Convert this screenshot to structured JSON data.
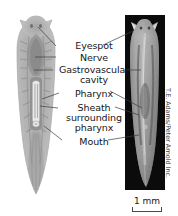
{
  "figure": {
    "type": "anatomical-diagram",
    "panels": [
      {
        "name": "left-specimen",
        "description": "stained whole-mount light micrograph on white background"
      },
      {
        "name": "right-specimen",
        "description": "dark-field micrograph on black background"
      }
    ]
  },
  "labels": {
    "eyespot": "Eyespot",
    "nerve": "Nerve",
    "gastrovascular_cavity": "Gastrovascular cavity",
    "gastrovascular_line1": "Gastrovascular",
    "gastrovascular_line2": "cavity",
    "pharynx": "Pharynx",
    "sheath_line1": "Sheath",
    "sheath_line2": "surrounding",
    "sheath_line3": "pharynx",
    "mouth": "Mouth"
  },
  "scale_bar": {
    "value": "1 mm"
  },
  "credit": {
    "text": "T.E. Adams/Peter Arnold Inc."
  },
  "colors": {
    "background": "#ffffff",
    "panel_dark": "#0b0b0b",
    "leader_line": "#3c3c3c",
    "text": "#171717",
    "credit_text": "#3a3a3a"
  }
}
